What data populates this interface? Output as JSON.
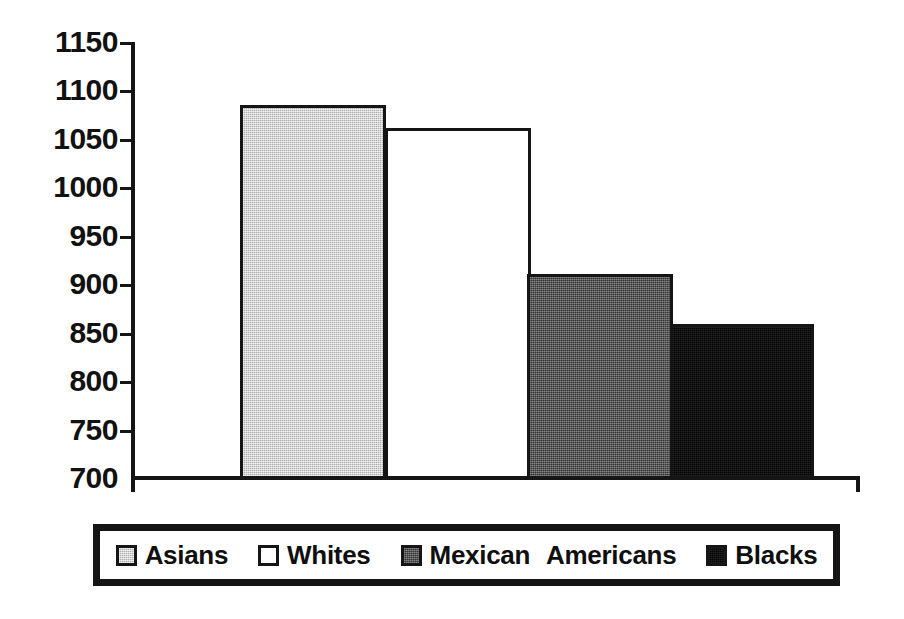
{
  "chart_data": {
    "type": "bar",
    "title": "",
    "subtitle": "",
    "xlabel": "",
    "ylabel": "",
    "categories": [
      "Asians",
      "Whites",
      "Mexican Americans",
      "Blacks"
    ],
    "values": [
      1085,
      1061,
      911,
      860
    ],
    "ylim": [
      700,
      1150
    ],
    "yticks": [
      1150,
      1100,
      1050,
      1000,
      950,
      900,
      850,
      800,
      750,
      700
    ],
    "ytick_labels": [
      "1150",
      "1100",
      "1050",
      "1000",
      "950",
      "900",
      "850",
      "800",
      "750",
      "700"
    ],
    "xtick_labels": [],
    "grid": false,
    "legend_position": "bottom",
    "series": [
      {
        "name": "Asians",
        "value": 1085,
        "fill": "light-gray",
        "color": "#c6c6c6"
      },
      {
        "name": "Whites",
        "value": 1061,
        "fill": "white",
        "color": "#ffffff"
      },
      {
        "name": "Mexican Americans",
        "value": 911,
        "fill": "dark-gray",
        "color": "#565656"
      },
      {
        "name": "Blacks",
        "value": 860,
        "fill": "black",
        "color": "#0d0d0d"
      }
    ]
  },
  "axis": {
    "ticks": [
      {
        "label": "1150"
      },
      {
        "label": "1100"
      },
      {
        "label": "1050"
      },
      {
        "label": "1000"
      },
      {
        "label": "950"
      },
      {
        "label": "900"
      },
      {
        "label": "850"
      },
      {
        "label": "800"
      },
      {
        "label": "750"
      },
      {
        "label": "700"
      }
    ]
  },
  "legend": {
    "items": [
      {
        "label": "Asians",
        "swatch": "light-gray-swatch"
      },
      {
        "label": "Whites",
        "swatch": "white-swatch"
      },
      {
        "label": "Mexican",
        "label2": "Americans",
        "swatch": "dark-gray-swatch"
      },
      {
        "label": "Blacks",
        "swatch": "black-swatch"
      }
    ]
  },
  "colors": {
    "ink": "#151515",
    "light_gray": "#c6c6c6",
    "white": "#ffffff",
    "dark_gray": "#565656",
    "black": "#0d0d0d",
    "background": "#ffffff"
  }
}
